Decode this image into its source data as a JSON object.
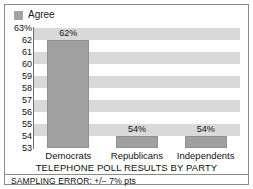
{
  "chart_data": {
    "type": "bar",
    "title": "",
    "xlabel": "TELEPHONE POLL RESULTS BY PARTY",
    "ylabel": "",
    "categories": [
      "Democrats",
      "Republicans",
      "Independents"
    ],
    "values": [
      62,
      54,
      54
    ],
    "value_labels": [
      "62%",
      "54%",
      "54%"
    ],
    "series": [
      {
        "name": "Agree",
        "values": [
          62,
          54,
          54
        ]
      }
    ],
    "ylim": [
      53,
      63
    ],
    "y_ticks": [
      63,
      62,
      61,
      60,
      59,
      58,
      57,
      56,
      55,
      54,
      53
    ],
    "y_tick_labels": [
      "63%",
      "62",
      "61",
      "60",
      "59",
      "58",
      "57",
      "56",
      "55",
      "54",
      "53"
    ],
    "grid": "alternating-horizontal-bands",
    "legend": {
      "position": "top-left",
      "entries": [
        "Agree"
      ]
    },
    "footnote": "SAMPLING ERROR: +/− 7% pts",
    "colors": {
      "bar": "#a0a0a0",
      "bar_border": "#919191",
      "band": "#d9d9d9",
      "background": "#ffffff",
      "axis": "#6d6d6d",
      "border": "#8a8a8a",
      "text": "#111111"
    }
  },
  "legend": {
    "swatch_name": "agree-swatch",
    "label": "Agree"
  },
  "axis": {
    "x_title": "TELEPHONE POLL RESULTS BY PARTY"
  },
  "footnote": {
    "text": "SAMPLING ERROR: +/− 7% pts"
  }
}
